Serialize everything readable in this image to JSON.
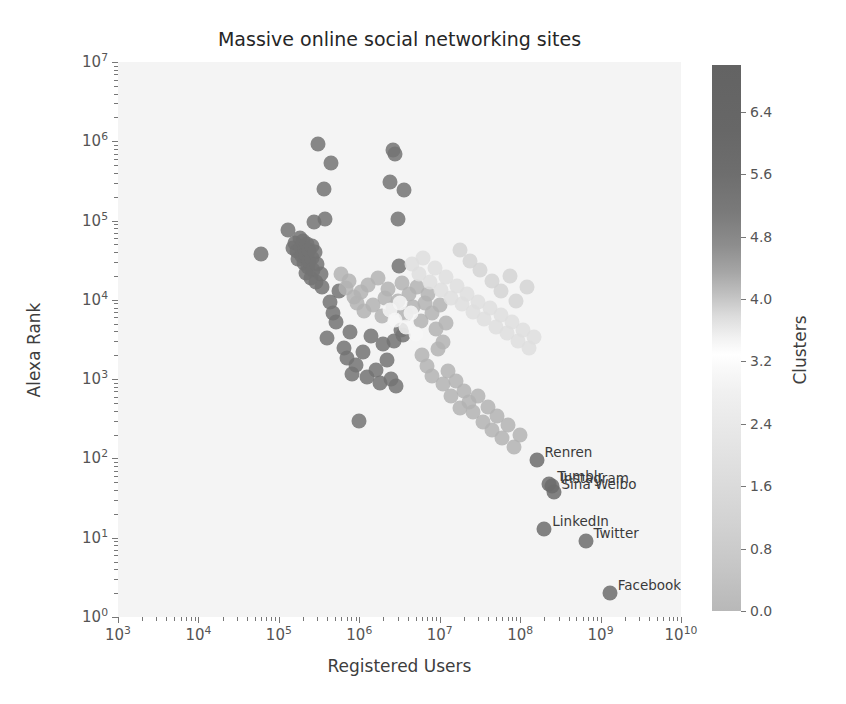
{
  "chart_data": {
    "type": "scatter",
    "title": "Massive online social networking sites",
    "xlabel": "Registered Users",
    "ylabel": "Alexa Rank",
    "xscale": "log",
    "yscale": "log",
    "xlim": [
      1000,
      10000000000
    ],
    "ylim": [
      1,
      10000000
    ],
    "grid": false,
    "xticklabels": [
      "10³",
      "10⁴",
      "10⁵",
      "10⁶",
      "10⁷",
      "10⁸",
      "10⁹",
      "10¹⁰"
    ],
    "xtick_mantissas": [
      3,
      4,
      5,
      6,
      7,
      8,
      9,
      10
    ],
    "yticklabels": [
      "10⁰",
      "10¹",
      "10²",
      "10³",
      "10⁴",
      "10⁵",
      "10⁶",
      "10⁷"
    ],
    "ytick_mantissas": [
      0,
      1,
      2,
      3,
      4,
      5,
      6,
      7
    ],
    "colorbar": {
      "label": "Clusters",
      "ticks": [
        0.0,
        0.8,
        1.6,
        2.4,
        3.2,
        4.0,
        4.8,
        5.6,
        6.4
      ],
      "ticklabels": [
        "0.0",
        "0.8",
        "1.6",
        "2.4",
        "3.2",
        "4.0",
        "4.8",
        "5.6",
        "6.4"
      ],
      "vmin": 0.0,
      "vmax": 7.0,
      "colormap": "gray-like",
      "position": "right"
    },
    "marker": {
      "shape": "circle",
      "size_px": 15,
      "opacity": 0.85
    },
    "annotations": [
      {
        "text": "Renren",
        "x": 160000000,
        "y": 95,
        "dx": 8,
        "dy": -16
      },
      {
        "text": "Tumblr",
        "x": 230000000,
        "y": 48,
        "dx": 8,
        "dy": -16
      },
      {
        "text": "Instagram",
        "x": 250000000,
        "y": 45,
        "dx": 8,
        "dy": -16
      },
      {
        "text": "Sina Weibo",
        "x": 260000000,
        "y": 38,
        "dx": 8,
        "dy": -16
      },
      {
        "text": "LinkedIn",
        "x": 200000000,
        "y": 13,
        "dx": 8,
        "dy": -16
      },
      {
        "text": "Twitter",
        "x": 650000000,
        "y": 9,
        "dx": 8,
        "dy": -16
      },
      {
        "text": "Facebook",
        "x": 1300000000,
        "y": 2,
        "dx": 8,
        "dy": -16
      }
    ],
    "points": [
      {
        "x": 60000,
        "y": 38000,
        "c": 5.4
      },
      {
        "x": 130000,
        "y": 75000,
        "c": 5.4
      },
      {
        "x": 150000,
        "y": 45000,
        "c": 5.4
      },
      {
        "x": 160000,
        "y": 52000,
        "c": 5.4
      },
      {
        "x": 170000,
        "y": 41000,
        "c": 5.4
      },
      {
        "x": 175000,
        "y": 33000,
        "c": 5.4
      },
      {
        "x": 185000,
        "y": 60000,
        "c": 5.4
      },
      {
        "x": 190000,
        "y": 47000,
        "c": 5.4
      },
      {
        "x": 195000,
        "y": 36000,
        "c": 5.4
      },
      {
        "x": 200000,
        "y": 55000,
        "c": 5.4
      },
      {
        "x": 205000,
        "y": 29000,
        "c": 5.4
      },
      {
        "x": 210000,
        "y": 44000,
        "c": 5.4
      },
      {
        "x": 215000,
        "y": 22000,
        "c": 5.4
      },
      {
        "x": 220000,
        "y": 38000,
        "c": 5.4
      },
      {
        "x": 225000,
        "y": 50000,
        "c": 5.4
      },
      {
        "x": 230000,
        "y": 26000,
        "c": 5.4
      },
      {
        "x": 235000,
        "y": 31000,
        "c": 5.4
      },
      {
        "x": 240000,
        "y": 42000,
        "c": 5.4
      },
      {
        "x": 250000,
        "y": 19000,
        "c": 5.4
      },
      {
        "x": 255000,
        "y": 34000,
        "c": 5.4
      },
      {
        "x": 260000,
        "y": 48000,
        "c": 5.4
      },
      {
        "x": 265000,
        "y": 24000,
        "c": 5.4
      },
      {
        "x": 270000,
        "y": 96000,
        "c": 5.4
      },
      {
        "x": 280000,
        "y": 40000,
        "c": 5.4
      },
      {
        "x": 290000,
        "y": 17000,
        "c": 5.4
      },
      {
        "x": 300000,
        "y": 28000,
        "c": 5.4
      },
      {
        "x": 310000,
        "y": 920000,
        "c": 5.4
      },
      {
        "x": 330000,
        "y": 21000,
        "c": 5.4
      },
      {
        "x": 340000,
        "y": 14500,
        "c": 5.4
      },
      {
        "x": 360000,
        "y": 250000,
        "c": 5.4
      },
      {
        "x": 380000,
        "y": 105000,
        "c": 5.4
      },
      {
        "x": 400000,
        "y": 3300,
        "c": 5.4
      },
      {
        "x": 430000,
        "y": 9500,
        "c": 5.4
      },
      {
        "x": 450000,
        "y": 540000,
        "c": 5.4
      },
      {
        "x": 470000,
        "y": 6800,
        "c": 5.4
      },
      {
        "x": 520000,
        "y": 5200,
        "c": 5.4
      },
      {
        "x": 560000,
        "y": 13000,
        "c": 5.4
      },
      {
        "x": 640000,
        "y": 2500,
        "c": 5.4
      },
      {
        "x": 700000,
        "y": 1850,
        "c": 5.4
      },
      {
        "x": 760000,
        "y": 3900,
        "c": 5.4
      },
      {
        "x": 820000,
        "y": 1150,
        "c": 5.4
      },
      {
        "x": 900000,
        "y": 1500,
        "c": 5.4
      },
      {
        "x": 1000000,
        "y": 300,
        "c": 5.4
      },
      {
        "x": 1100000,
        "y": 2200,
        "c": 5.4
      },
      {
        "x": 1250000,
        "y": 1050,
        "c": 5.4
      },
      {
        "x": 1400000,
        "y": 3500,
        "c": 5.4
      },
      {
        "x": 1600000,
        "y": 1300,
        "c": 5.4
      },
      {
        "x": 1800000,
        "y": 890,
        "c": 5.4
      },
      {
        "x": 2000000,
        "y": 2800,
        "c": 5.4
      },
      {
        "x": 2200000,
        "y": 1750,
        "c": 5.4
      },
      {
        "x": 2500000,
        "y": 1000,
        "c": 5.4
      },
      {
        "x": 2700000,
        "y": 3000,
        "c": 5.4
      },
      {
        "x": 2900000,
        "y": 820,
        "c": 5.4
      },
      {
        "x": 2600000,
        "y": 780000,
        "c": 5.4
      },
      {
        "x": 2750000,
        "y": 700000,
        "c": 5.4
      },
      {
        "x": 2400000,
        "y": 310000,
        "c": 5.4
      },
      {
        "x": 3600000,
        "y": 240000,
        "c": 5.4
      },
      {
        "x": 3000000,
        "y": 105000,
        "c": 5.4
      },
      {
        "x": 3100000,
        "y": 27000,
        "c": 5.4
      },
      {
        "x": 3300000,
        "y": 4200,
        "c": 5.4
      },
      {
        "x": 3500000,
        "y": 3600,
        "c": 5.4
      },
      {
        "x": 600000,
        "y": 21000,
        "c": 4.2
      },
      {
        "x": 680000,
        "y": 14000,
        "c": 4.2
      },
      {
        "x": 750000,
        "y": 17500,
        "c": 4.2
      },
      {
        "x": 850000,
        "y": 11000,
        "c": 4.2
      },
      {
        "x": 950000,
        "y": 9000,
        "c": 4.2
      },
      {
        "x": 1050000,
        "y": 12500,
        "c": 4.2
      },
      {
        "x": 1150000,
        "y": 7200,
        "c": 4.2
      },
      {
        "x": 1300000,
        "y": 15500,
        "c": 4.2
      },
      {
        "x": 1500000,
        "y": 8600,
        "c": 4.2
      },
      {
        "x": 1700000,
        "y": 19000,
        "c": 4.2
      },
      {
        "x": 1900000,
        "y": 6200,
        "c": 4.2
      },
      {
        "x": 2100000,
        "y": 10500,
        "c": 4.2
      },
      {
        "x": 2300000,
        "y": 13800,
        "c": 4.2
      },
      {
        "x": 2600000,
        "y": 7800,
        "c": 4.2
      },
      {
        "x": 3000000,
        "y": 9800,
        "c": 4.2
      },
      {
        "x": 3400000,
        "y": 16500,
        "c": 4.2
      },
      {
        "x": 3800000,
        "y": 6600,
        "c": 4.2
      },
      {
        "x": 4200000,
        "y": 11800,
        "c": 4.2
      },
      {
        "x": 4700000,
        "y": 8200,
        "c": 4.2
      },
      {
        "x": 5200000,
        "y": 14500,
        "c": 4.2
      },
      {
        "x": 5800000,
        "y": 5400,
        "c": 4.2
      },
      {
        "x": 6500000,
        "y": 9200,
        "c": 4.2
      },
      {
        "x": 7200000,
        "y": 12000,
        "c": 4.2
      },
      {
        "x": 8000000,
        "y": 6900,
        "c": 4.2
      },
      {
        "x": 9000000,
        "y": 4300,
        "c": 4.2
      },
      {
        "x": 10000000,
        "y": 8500,
        "c": 4.2
      },
      {
        "x": 11000000,
        "y": 2900,
        "c": 4.2
      },
      {
        "x": 12000000,
        "y": 5100,
        "c": 4.2
      },
      {
        "x": 6000000,
        "y": 2000,
        "c": 4.2
      },
      {
        "x": 7000000,
        "y": 1450,
        "c": 4.2
      },
      {
        "x": 8000000,
        "y": 1100,
        "c": 4.2
      },
      {
        "x": 9500000,
        "y": 2400,
        "c": 4.2
      },
      {
        "x": 11000000,
        "y": 860,
        "c": 4.2
      },
      {
        "x": 12500000,
        "y": 1250,
        "c": 4.2
      },
      {
        "x": 14000000,
        "y": 620,
        "c": 4.2
      },
      {
        "x": 16000000,
        "y": 950,
        "c": 4.2
      },
      {
        "x": 18000000,
        "y": 430,
        "c": 4.2
      },
      {
        "x": 20000000,
        "y": 700,
        "c": 4.2
      },
      {
        "x": 23000000,
        "y": 520,
        "c": 4.2
      },
      {
        "x": 26000000,
        "y": 380,
        "c": 4.2
      },
      {
        "x": 30000000,
        "y": 620,
        "c": 4.2
      },
      {
        "x": 35000000,
        "y": 290,
        "c": 4.2
      },
      {
        "x": 40000000,
        "y": 450,
        "c": 4.2
      },
      {
        "x": 45000000,
        "y": 230,
        "c": 4.2
      },
      {
        "x": 52000000,
        "y": 340,
        "c": 4.2
      },
      {
        "x": 60000000,
        "y": 180,
        "c": 4.2
      },
      {
        "x": 70000000,
        "y": 265,
        "c": 4.2
      },
      {
        "x": 85000000,
        "y": 140,
        "c": 4.2
      },
      {
        "x": 100000000,
        "y": 200,
        "c": 4.2
      },
      {
        "x": 160000000,
        "y": 95,
        "c": 5.8
      },
      {
        "x": 230000000,
        "y": 48,
        "c": 5.8
      },
      {
        "x": 250000000,
        "y": 45,
        "c": 5.8
      },
      {
        "x": 260000000,
        "y": 38,
        "c": 5.8
      },
      {
        "x": 200000000,
        "y": 13,
        "c": 5.8
      },
      {
        "x": 650000000,
        "y": 9,
        "c": 5.8
      },
      {
        "x": 1300000000,
        "y": 2,
        "c": 5.8
      },
      {
        "x": 4500000,
        "y": 28000,
        "c": 1.8
      },
      {
        "x": 5500000,
        "y": 21000,
        "c": 1.8
      },
      {
        "x": 6200000,
        "y": 34000,
        "c": 1.8
      },
      {
        "x": 7500000,
        "y": 17000,
        "c": 1.8
      },
      {
        "x": 8800000,
        "y": 25000,
        "c": 1.8
      },
      {
        "x": 10500000,
        "y": 13500,
        "c": 1.8
      },
      {
        "x": 12000000,
        "y": 19500,
        "c": 1.8
      },
      {
        "x": 14000000,
        "y": 10500,
        "c": 1.8
      },
      {
        "x": 16500000,
        "y": 15000,
        "c": 1.8
      },
      {
        "x": 19000000,
        "y": 8800,
        "c": 1.8
      },
      {
        "x": 22000000,
        "y": 12000,
        "c": 1.8
      },
      {
        "x": 26000000,
        "y": 7000,
        "c": 1.8
      },
      {
        "x": 30000000,
        "y": 9500,
        "c": 1.8
      },
      {
        "x": 36000000,
        "y": 5800,
        "c": 1.8
      },
      {
        "x": 42000000,
        "y": 8000,
        "c": 1.8
      },
      {
        "x": 50000000,
        "y": 4600,
        "c": 1.8
      },
      {
        "x": 58000000,
        "y": 6500,
        "c": 1.8
      },
      {
        "x": 68000000,
        "y": 3800,
        "c": 1.8
      },
      {
        "x": 80000000,
        "y": 5200,
        "c": 1.8
      },
      {
        "x": 95000000,
        "y": 3000,
        "c": 1.8
      },
      {
        "x": 110000000,
        "y": 4200,
        "c": 1.8
      },
      {
        "x": 130000000,
        "y": 2500,
        "c": 1.8
      },
      {
        "x": 150000000,
        "y": 3400,
        "c": 1.8
      },
      {
        "x": 18000000,
        "y": 42000,
        "c": 1.2
      },
      {
        "x": 24000000,
        "y": 31000,
        "c": 1.2
      },
      {
        "x": 32000000,
        "y": 24000,
        "c": 1.2
      },
      {
        "x": 45000000,
        "y": 17500,
        "c": 1.2
      },
      {
        "x": 58000000,
        "y": 13000,
        "c": 1.2
      },
      {
        "x": 75000000,
        "y": 20000,
        "c": 1.2
      },
      {
        "x": 90000000,
        "y": 9800,
        "c": 1.2
      },
      {
        "x": 120000000,
        "y": 14500,
        "c": 1.2
      },
      {
        "x": 2400000,
        "y": 7500,
        "c": 3.0
      },
      {
        "x": 2800000,
        "y": 5600,
        "c": 3.0
      },
      {
        "x": 3200000,
        "y": 9000,
        "c": 3.0
      },
      {
        "x": 3800000,
        "y": 4600,
        "c": 3.0
      },
      {
        "x": 4400000,
        "y": 6800,
        "c": 3.0
      },
      {
        "x": 5000000,
        "y": 3700,
        "c": 3.0
      }
    ]
  }
}
